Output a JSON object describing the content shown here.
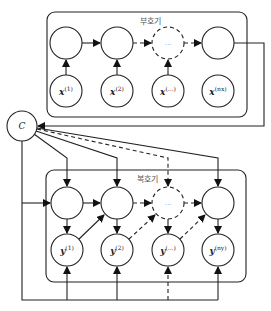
{
  "encoder": {
    "label": "부호기",
    "inputs": [
      {
        "base": "x",
        "sup": "(1)"
      },
      {
        "base": "x",
        "sup": "(2)"
      },
      {
        "base": "x",
        "sup": "(...)"
      },
      {
        "base": "x",
        "sup": "(nx)"
      }
    ],
    "hidden_dots": "..."
  },
  "context": {
    "label": "C"
  },
  "decoder": {
    "label": "복호기",
    "outputs": [
      {
        "base": "y",
        "sup": "(1)"
      },
      {
        "base": "y",
        "sup": "(2)"
      },
      {
        "base": "y",
        "sup": "(...)"
      },
      {
        "base": "y",
        "sup": "(ny)"
      }
    ],
    "hidden_dots": "..."
  },
  "colors": {
    "stroke": "#222222",
    "label": "#555555"
  }
}
